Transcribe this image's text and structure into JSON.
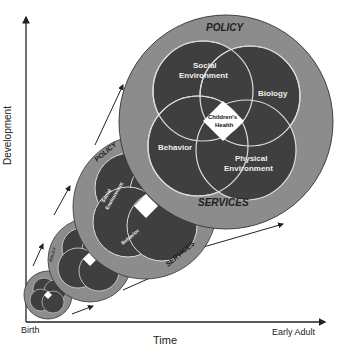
{
  "axes": {
    "y_label": "Development",
    "x_label": "Time",
    "x_start": "Birth",
    "x_end": "Early Adult"
  },
  "circles": [
    {
      "stage": 1,
      "outer_top": "POLICY",
      "outer_bottom": "SERVICES",
      "inner": [
        "Social Environment",
        "Biology",
        "Behavior",
        "Physical Environment"
      ],
      "center": "Children's Health"
    },
    {
      "stage": 2,
      "outer_top": "POLICY",
      "outer_bottom": "SERVICES",
      "inner": [
        "Social Environment",
        "Biology",
        "Behavior",
        "Physical Environment"
      ],
      "center": "Children's Health"
    },
    {
      "stage": 3,
      "outer_top": "POLICY",
      "outer_bottom": "SERVICES",
      "inner": [
        "Social Environment",
        "Biology",
        "Behavior",
        "Physical Environment"
      ],
      "center": "Children's Health"
    },
    {
      "stage": 4,
      "outer_top": "POLICY",
      "outer_bottom": "SERVICES",
      "inner": [
        "Social Environment",
        "Biology",
        "Behavior",
        "Physical Environment"
      ],
      "center": "Children's Health"
    }
  ],
  "main": {
    "policy": "POLICY",
    "services": "SERVICES",
    "social1": "Social",
    "social2": "Environment",
    "biology": "Biology",
    "behavior": "Behavior",
    "physical1": "Physical",
    "physical2": "Environment",
    "center1": "Children's",
    "center2": "Health"
  },
  "mid": {
    "policy": "POLICY",
    "services": "SERVICES",
    "social": "Social Environment",
    "behavior": "Behavior"
  },
  "colors": {
    "outer_ring": "#8c8c8c",
    "inner_circle": "#3f3f3f",
    "circle_stroke": "#e0e0e0",
    "center": "#ffffff",
    "axis": "#222222"
  }
}
